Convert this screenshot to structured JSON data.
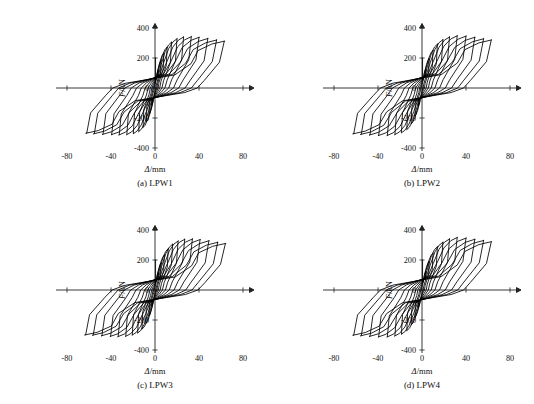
{
  "figure": {
    "background_color": "#ffffff",
    "line_color": "#000000",
    "width": 534,
    "height": 404
  },
  "panels": [
    {
      "id": "lpw1",
      "caption": "(a) LPW1",
      "xlabel_symbol": "Δ",
      "xlabel_unit": "/mm",
      "ylabel_symbol": "F",
      "ylabel_unit": "/kN"
    },
    {
      "id": "lpw2",
      "caption": "(b) LPW2",
      "xlabel_symbol": "Δ",
      "xlabel_unit": "/mm",
      "ylabel_symbol": "F",
      "ylabel_unit": "/kN"
    },
    {
      "id": "lpw3",
      "caption": "(c) LPW3",
      "xlabel_symbol": "Δ",
      "xlabel_unit": "/mm",
      "ylabel_symbol": "F",
      "ylabel_unit": "/kN"
    },
    {
      "id": "lpw4",
      "caption": "(d) LPW4",
      "xlabel_symbol": "Δ",
      "xlabel_unit": "/mm",
      "ylabel_symbol": "F",
      "ylabel_unit": "/kN"
    }
  ],
  "chart_data": [
    {
      "type": "line",
      "title": "(a) LPW1",
      "xlabel": "Δ/mm",
      "ylabel": "F/kN",
      "xlim": [
        -90,
        90
      ],
      "ylim": [
        -420,
        430
      ],
      "xticks": [
        -80,
        -40,
        0,
        40,
        80
      ],
      "yticks": [
        -400,
        -200,
        0,
        200,
        400
      ],
      "xtick_labels": [
        "-80",
        "-40",
        "0",
        "40",
        "80"
      ],
      "ytick_labels": [
        "-400",
        "-200",
        "0",
        "200",
        "400"
      ],
      "grid": false,
      "legend": "none",
      "description": "Force-displacement hysteresis loops, specimen LPW1, 12 symmetric cycles of increasing amplitude",
      "cycles": [
        {
          "amp": 3.0,
          "fpos": 118,
          "fneg": -112,
          "pinch": 0.3,
          "res_pos": 0.3,
          "res_neg": 0.3
        },
        {
          "amp": 5.5,
          "fpos": 182,
          "fneg": -176,
          "pinch": 0.32,
          "res_pos": 0.33,
          "res_neg": 0.33
        },
        {
          "amp": 8.0,
          "fpos": 232,
          "fneg": -226,
          "pinch": 0.34,
          "res_pos": 0.36,
          "res_neg": 0.36
        },
        {
          "amp": 11.0,
          "fpos": 272,
          "fneg": -264,
          "pinch": 0.36,
          "res_pos": 0.39,
          "res_neg": 0.39
        },
        {
          "amp": 15.0,
          "fpos": 305,
          "fneg": -292,
          "pinch": 0.38,
          "res_pos": 0.42,
          "res_neg": 0.42
        },
        {
          "amp": 20.0,
          "fpos": 328,
          "fneg": -306,
          "pinch": 0.4,
          "res_pos": 0.45,
          "res_neg": 0.45
        },
        {
          "amp": 26.0,
          "fpos": 340,
          "fneg": -312,
          "pinch": 0.42,
          "res_pos": 0.48,
          "res_neg": 0.48
        },
        {
          "amp": 33.0,
          "fpos": 342,
          "fneg": -314,
          "pinch": 0.44,
          "res_pos": 0.51,
          "res_neg": 0.51
        },
        {
          "amp": 40.0,
          "fpos": 338,
          "fneg": -312,
          "pinch": 0.46,
          "res_pos": 0.54,
          "res_neg": 0.54
        },
        {
          "amp": 48.0,
          "fpos": 330,
          "fneg": -310,
          "pinch": 0.48,
          "res_pos": 0.57,
          "res_neg": 0.57
        },
        {
          "amp": 56.0,
          "fpos": 320,
          "fneg": -306,
          "pinch": 0.5,
          "res_pos": 0.59,
          "res_neg": 0.59
        },
        {
          "amp": 63.0,
          "fpos": 312,
          "fneg": -302,
          "pinch": 0.52,
          "res_pos": 0.61,
          "res_neg": 0.61
        }
      ]
    },
    {
      "type": "line",
      "title": "(b) LPW2",
      "xlabel": "Δ/mm",
      "ylabel": "F/kN",
      "xlim": [
        -90,
        90
      ],
      "ylim": [
        -420,
        430
      ],
      "xticks": [
        -80,
        -40,
        0,
        40,
        80
      ],
      "yticks": [
        -400,
        -200,
        0,
        200,
        400
      ],
      "xtick_labels": [
        "-80",
        "-40",
        "0",
        "40",
        "80"
      ],
      "ytick_labels": [
        "-400",
        "-200",
        "0",
        "200",
        "400"
      ],
      "grid": false,
      "legend": "none",
      "description": "Force-displacement hysteresis loops, specimen LPW2, 11 symmetric cycles of increasing amplitude",
      "cycles": [
        {
          "amp": 3.5,
          "fpos": 126,
          "fneg": -120,
          "pinch": 0.31,
          "res_pos": 0.31,
          "res_neg": 0.31
        },
        {
          "amp": 6.5,
          "fpos": 195,
          "fneg": -188,
          "pinch": 0.33,
          "res_pos": 0.34,
          "res_neg": 0.34
        },
        {
          "amp": 10.0,
          "fpos": 250,
          "fneg": -240,
          "pinch": 0.35,
          "res_pos": 0.38,
          "res_neg": 0.38
        },
        {
          "amp": 14.0,
          "fpos": 292,
          "fneg": -278,
          "pinch": 0.37,
          "res_pos": 0.41,
          "res_neg": 0.41
        },
        {
          "amp": 19.0,
          "fpos": 322,
          "fneg": -300,
          "pinch": 0.39,
          "res_pos": 0.44,
          "res_neg": 0.44
        },
        {
          "amp": 25.0,
          "fpos": 340,
          "fneg": -312,
          "pinch": 0.41,
          "res_pos": 0.47,
          "res_neg": 0.47
        },
        {
          "amp": 32.0,
          "fpos": 348,
          "fneg": -318,
          "pinch": 0.43,
          "res_pos": 0.5,
          "res_neg": 0.5
        },
        {
          "amp": 40.0,
          "fpos": 346,
          "fneg": -318,
          "pinch": 0.45,
          "res_pos": 0.53,
          "res_neg": 0.53
        },
        {
          "amp": 48.0,
          "fpos": 338,
          "fneg": -314,
          "pinch": 0.47,
          "res_pos": 0.56,
          "res_neg": 0.56
        },
        {
          "amp": 56.0,
          "fpos": 328,
          "fneg": -310,
          "pinch": 0.49,
          "res_pos": 0.58,
          "res_neg": 0.58
        },
        {
          "amp": 63.0,
          "fpos": 320,
          "fneg": -306,
          "pinch": 0.51,
          "res_pos": 0.6,
          "res_neg": 0.6
        }
      ]
    },
    {
      "type": "line",
      "title": "(c) LPW3",
      "xlabel": "Δ/mm",
      "ylabel": "F/kN",
      "xlim": [
        -90,
        90
      ],
      "ylim": [
        -420,
        430
      ],
      "xticks": [
        -80,
        -40,
        0,
        40,
        80
      ],
      "yticks": [
        -400,
        -200,
        0,
        200,
        400
      ],
      "xtick_labels": [
        "-80",
        "-40",
        "0",
        "40",
        "80"
      ],
      "ytick_labels": [
        "-400",
        "-200",
        "0",
        "200",
        "400"
      ],
      "grid": false,
      "legend": "none",
      "description": "Force-displacement hysteresis loops, specimen LPW3, 12 symmetric cycles of increasing amplitude",
      "cycles": [
        {
          "amp": 3.0,
          "fpos": 115,
          "fneg": -110,
          "pinch": 0.3,
          "res_pos": 0.3,
          "res_neg": 0.3
        },
        {
          "amp": 5.5,
          "fpos": 178,
          "fneg": -172,
          "pinch": 0.32,
          "res_pos": 0.33,
          "res_neg": 0.33
        },
        {
          "amp": 8.5,
          "fpos": 232,
          "fneg": -224,
          "pinch": 0.34,
          "res_pos": 0.36,
          "res_neg": 0.36
        },
        {
          "amp": 12.0,
          "fpos": 275,
          "fneg": -262,
          "pinch": 0.36,
          "res_pos": 0.39,
          "res_neg": 0.39
        },
        {
          "amp": 16.0,
          "fpos": 305,
          "fneg": -288,
          "pinch": 0.38,
          "res_pos": 0.42,
          "res_neg": 0.42
        },
        {
          "amp": 21.0,
          "fpos": 326,
          "fneg": -302,
          "pinch": 0.4,
          "res_pos": 0.45,
          "res_neg": 0.45
        },
        {
          "amp": 27.0,
          "fpos": 338,
          "fneg": -310,
          "pinch": 0.42,
          "res_pos": 0.48,
          "res_neg": 0.48
        },
        {
          "amp": 34.0,
          "fpos": 340,
          "fneg": -312,
          "pinch": 0.44,
          "res_pos": 0.51,
          "res_neg": 0.51
        },
        {
          "amp": 41.0,
          "fpos": 336,
          "fneg": -310,
          "pinch": 0.46,
          "res_pos": 0.54,
          "res_neg": 0.54
        },
        {
          "amp": 49.0,
          "fpos": 328,
          "fneg": -306,
          "pinch": 0.48,
          "res_pos": 0.57,
          "res_neg": 0.57
        },
        {
          "amp": 57.0,
          "fpos": 318,
          "fneg": -302,
          "pinch": 0.5,
          "res_pos": 0.59,
          "res_neg": 0.59
        },
        {
          "amp": 64.0,
          "fpos": 310,
          "fneg": -300,
          "pinch": 0.52,
          "res_pos": 0.61,
          "res_neg": 0.61
        }
      ]
    },
    {
      "type": "line",
      "title": "(d) LPW4",
      "xlabel": "Δ/mm",
      "ylabel": "F/kN",
      "xlim": [
        -90,
        90
      ],
      "ylim": [
        -420,
        430
      ],
      "xticks": [
        -80,
        -40,
        0,
        40,
        80
      ],
      "yticks": [
        -400,
        -200,
        0,
        200,
        400
      ],
      "xtick_labels": [
        "-80",
        "-40",
        "0",
        "40",
        "80"
      ],
      "ytick_labels": [
        "-400",
        "-200",
        "0",
        "200",
        "400"
      ],
      "grid": false,
      "legend": "none",
      "description": "Force-displacement hysteresis loops, specimen LPW4, 11 symmetric cycles of increasing amplitude",
      "cycles": [
        {
          "amp": 3.5,
          "fpos": 122,
          "fneg": -116,
          "pinch": 0.31,
          "res_pos": 0.31,
          "res_neg": 0.31
        },
        {
          "amp": 6.5,
          "fpos": 190,
          "fneg": -182,
          "pinch": 0.33,
          "res_pos": 0.34,
          "res_neg": 0.34
        },
        {
          "amp": 10.0,
          "fpos": 245,
          "fneg": -234,
          "pinch": 0.35,
          "res_pos": 0.38,
          "res_neg": 0.38
        },
        {
          "amp": 14.0,
          "fpos": 288,
          "fneg": -272,
          "pinch": 0.37,
          "res_pos": 0.41,
          "res_neg": 0.41
        },
        {
          "amp": 19.0,
          "fpos": 318,
          "fneg": -296,
          "pinch": 0.39,
          "res_pos": 0.44,
          "res_neg": 0.44
        },
        {
          "amp": 25.0,
          "fpos": 340,
          "fneg": -308,
          "pinch": 0.41,
          "res_pos": 0.47,
          "res_neg": 0.47
        },
        {
          "amp": 32.0,
          "fpos": 350,
          "fneg": -314,
          "pinch": 0.43,
          "res_pos": 0.5,
          "res_neg": 0.5
        },
        {
          "amp": 40.0,
          "fpos": 346,
          "fneg": -314,
          "pinch": 0.45,
          "res_pos": 0.53,
          "res_neg": 0.53
        },
        {
          "amp": 48.0,
          "fpos": 338,
          "fneg": -310,
          "pinch": 0.47,
          "res_pos": 0.56,
          "res_neg": 0.56
        },
        {
          "amp": 56.0,
          "fpos": 330,
          "fneg": -306,
          "pinch": 0.49,
          "res_pos": 0.58,
          "res_neg": 0.58
        },
        {
          "amp": 63.0,
          "fpos": 322,
          "fneg": -302,
          "pinch": 0.51,
          "res_pos": 0.6,
          "res_neg": 0.6
        }
      ]
    }
  ]
}
